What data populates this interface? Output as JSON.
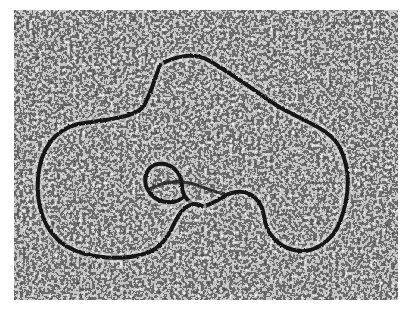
{
  "image": {
    "title": "Electron micrograph of a circular DNA molecule",
    "caption": "",
    "subject": "DNA loop strand on stained grainy background",
    "colors": {
      "background_light": "#d8d8d8",
      "background_dark": "#1a1a1a",
      "strand": "#151515"
    }
  }
}
